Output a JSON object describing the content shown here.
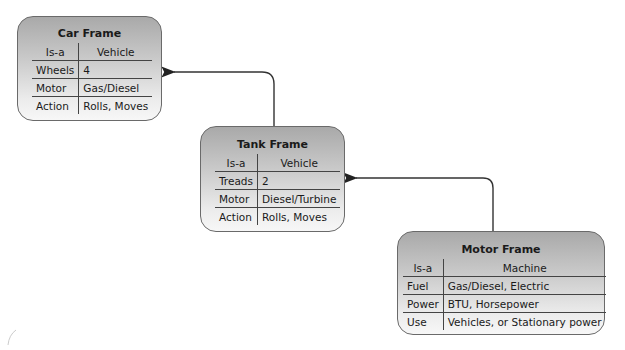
{
  "frames": {
    "car": {
      "title": "Car Frame",
      "isa_label": "Is-a",
      "isa_value": "Vehicle",
      "slots": [
        {
          "name": "Wheels",
          "value": "4"
        },
        {
          "name": "Motor",
          "value": "Gas/Diesel"
        },
        {
          "name": "Action",
          "value": "Rolls, Moves"
        }
      ]
    },
    "tank": {
      "title": "Tank Frame",
      "isa_label": "Is-a",
      "isa_value": "Vehicle",
      "slots": [
        {
          "name": "Treads",
          "value": "2"
        },
        {
          "name": "Motor",
          "value": "Diesel/Turbine"
        },
        {
          "name": "Action",
          "value": "Rolls, Moves"
        }
      ]
    },
    "motor": {
      "title": "Motor Frame",
      "isa_label": "Is-a",
      "isa_value": "Machine",
      "slots": [
        {
          "name": "Fuel",
          "value": "Gas/Diesel, Electric"
        },
        {
          "name": "Power",
          "value": "BTU, Horsepower"
        },
        {
          "name": "Use",
          "value": "Vehicles, or Stationary power"
        }
      ]
    }
  },
  "links": [
    {
      "from": "tank",
      "to": "car"
    },
    {
      "from": "motor",
      "to": "tank"
    }
  ]
}
